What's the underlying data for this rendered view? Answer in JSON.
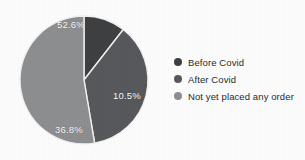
{
  "chart_data": {
    "type": "pie",
    "title": "",
    "subtitle": "",
    "xlabel": "",
    "ylabel": "",
    "grid": false,
    "legend_position": "right",
    "start_angle_deg": 0,
    "direction": "clockwise",
    "categories": [
      "Before Covid",
      "After Covid",
      "Not yet placed any order"
    ],
    "values": [
      10.5,
      36.8,
      52.6
    ],
    "value_unit": "%",
    "slice_labels": [
      "10.5%",
      "36.8%",
      "52.6%"
    ],
    "colors": [
      "#3f4042",
      "#58595c",
      "#8d8f91"
    ],
    "slices": [
      {
        "label": "Before Covid",
        "value": 10.5,
        "display": "10.5%",
        "color": "#3f4042"
      },
      {
        "label": "After Covid",
        "value": 36.8,
        "display": "36.8%",
        "color": "#58595c"
      },
      {
        "label": "Not yet placed any order",
        "value": 52.6,
        "display": "52.6%",
        "color": "#8d8f91"
      }
    ]
  },
  "legend": {
    "items": [
      {
        "label": "Before Covid",
        "color": "#3f4042"
      },
      {
        "label": "After Covid",
        "color": "#58595c"
      },
      {
        "label": "Not yet placed any order",
        "color": "#8d8f91"
      }
    ]
  },
  "labels": {
    "top": "52.6%",
    "right": "10.5%",
    "bottom": "36.8%"
  },
  "style": {
    "background": "#fdfdfd",
    "label_text_color": "#ffffff",
    "legend_text_color": "#2b2b2b",
    "slice_divider_color": "#f2f2f2"
  }
}
